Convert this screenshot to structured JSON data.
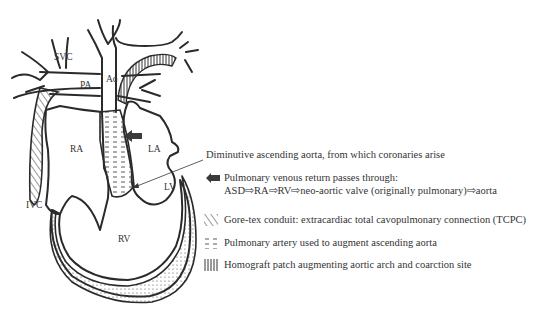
{
  "anatomy_labels": {
    "svc": "SVC",
    "pa": "PA",
    "ao": "Ao",
    "ra": "RA",
    "la": "LA",
    "lv": "LV",
    "rv": "RV",
    "ivc": "IVC"
  },
  "annotations": {
    "ascending_aorta": "Diminutive ascending aorta, from which coronaries arise",
    "venous_return_title": "Pulmonary venous return passes through:",
    "venous_return_path": "ASD⇨RA⇨RV⇨neo-aortic valve (originally pulmonary)⇨aorta"
  },
  "legend": [
    {
      "pattern": "diagonal-hatch",
      "label": "Gore-tex conduit: extracardiac total cavopulmonary connection (TCPC)"
    },
    {
      "pattern": "horizontal-dashes",
      "label": "Pulmonary artery used to augment ascending aorta"
    },
    {
      "pattern": "vertical-stripes",
      "label": "Homograft patch augmenting aortic arch and coarction site"
    }
  ],
  "colors": {
    "line": "#2a2a2a",
    "text": "#333333",
    "arrow": "#3a3a3a",
    "background": "#ffffff"
  }
}
